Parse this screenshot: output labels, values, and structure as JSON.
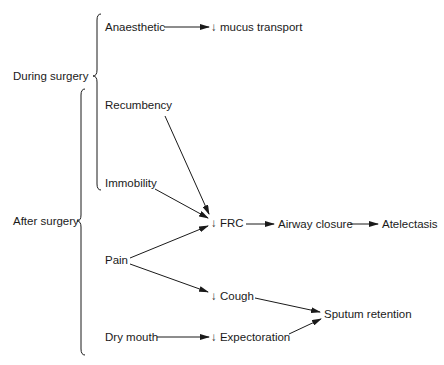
{
  "diagram": {
    "type": "flowchart",
    "groups": [
      {
        "id": "during",
        "label": "During surgery"
      },
      {
        "id": "after",
        "label": "After surgery"
      }
    ],
    "nodes": {
      "anaesthetic": "Anaesthetic",
      "mucus_transport": "↓ mucus transport",
      "recumbency": "Recumbency",
      "immobility": "Immobility",
      "frc": "↓ FRC",
      "airway_closure": "Airway closure",
      "atelectasis": "Atelectasis",
      "pain": "Pain",
      "cough": "↓ Cough",
      "sputum_retention": "Sputum retention",
      "dry_mouth": "Dry mouth",
      "expectoration": "↓ Expectoration"
    },
    "edges": [
      {
        "from": "Anaesthetic",
        "to": "↓ mucus transport"
      },
      {
        "from": "Recumbency",
        "to": "↓ FRC"
      },
      {
        "from": "Immobility",
        "to": "↓ FRC"
      },
      {
        "from": "Pain",
        "to": "↓ FRC"
      },
      {
        "from": "Pain",
        "to": "↓ Cough"
      },
      {
        "from": "↓ FRC",
        "to": "Airway closure"
      },
      {
        "from": "Airway closure",
        "to": "Atelectasis"
      },
      {
        "from": "↓ Cough",
        "to": "Sputum retention"
      },
      {
        "from": "Dry mouth",
        "to": "↓ Expectoration"
      },
      {
        "from": "↓ Expectoration",
        "to": "Sputum retention"
      }
    ],
    "colors": {
      "line": "#1a1a1a",
      "background": "#ffffff"
    }
  }
}
